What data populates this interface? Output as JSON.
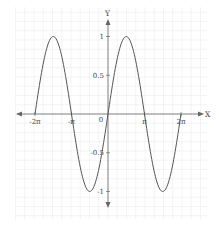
{
  "chart_data": {
    "type": "line",
    "title": "",
    "xlabel": "X",
    "ylabel": "Y",
    "function": "y = sin(x)",
    "xlim": [
      -6.2832,
      6.2832
    ],
    "ylim": [
      -1,
      1
    ],
    "grid": true,
    "legend": null,
    "x_ticks": [
      {
        "value": -6.2832,
        "label": "-2π"
      },
      {
        "value": -3.1416,
        "label": "-π"
      },
      {
        "value": 0,
        "label": "0"
      },
      {
        "value": 3.1416,
        "label": "π"
      },
      {
        "value": 6.2832,
        "label": "2π"
      }
    ],
    "y_ticks": [
      {
        "value": 1,
        "label": "1"
      },
      {
        "value": 0.5,
        "label": "0.5"
      },
      {
        "value": -0.5,
        "label": "-0.5"
      },
      {
        "value": -1,
        "label": "-1"
      }
    ],
    "series": [
      {
        "name": "sin(x)",
        "color": "#555555",
        "x": [
          -6.2832,
          -4.7124,
          -3.1416,
          -1.5708,
          0,
          1.5708,
          3.1416,
          4.7124,
          6.2832
        ],
        "values": [
          0,
          1,
          0,
          -1,
          0,
          1,
          0,
          -1,
          0
        ]
      }
    ]
  },
  "colors": {
    "grid": "#ececec",
    "axis": "#666666",
    "curve": "#555555",
    "background": "#ffffff"
  }
}
